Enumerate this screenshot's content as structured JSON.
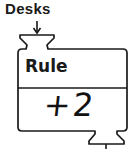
{
  "block": {
    "input_label": "Desks",
    "header": "Rule",
    "value": "+2"
  },
  "colors": {
    "stroke": "#1a1a1a",
    "background": "#ffffff"
  }
}
